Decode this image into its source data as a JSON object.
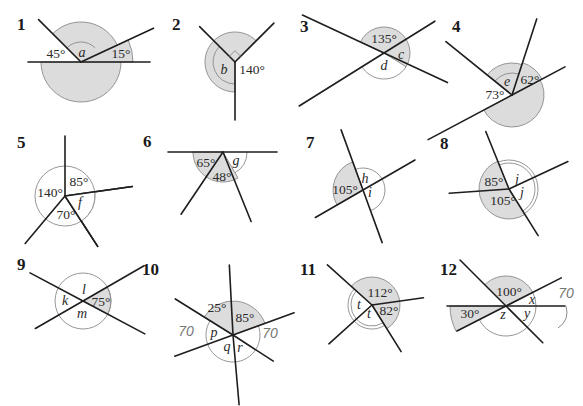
{
  "colors": {
    "shade": "#dcdcdc",
    "line": "#1e1e1e",
    "arc": "#8a8a8a"
  },
  "problems": [
    {
      "number": "1",
      "labels": [
        "45°",
        "a",
        "15°"
      ],
      "given": {
        "45°": 45,
        "15°": 15
      },
      "unknowns": [
        "a"
      ]
    },
    {
      "number": "2",
      "labels": [
        "b",
        "140°"
      ],
      "given": {
        "140°": 140,
        "right_angle": 90
      },
      "unknowns": [
        "b"
      ]
    },
    {
      "number": "3",
      "labels": [
        "135°",
        "c",
        "d"
      ],
      "given": {
        "135°": 135
      },
      "unknowns": [
        "c",
        "d"
      ]
    },
    {
      "number": "4",
      "labels": [
        "e",
        "62°",
        "73°"
      ],
      "given": {
        "62°": 62,
        "73°": 73
      },
      "unknowns": [
        "e"
      ]
    },
    {
      "number": "5",
      "labels": [
        "140°",
        "85°",
        "f",
        "70°"
      ],
      "given": {
        "140°": 140,
        "85°": 85,
        "70°": 70
      },
      "unknowns": [
        "f"
      ]
    },
    {
      "number": "6",
      "labels": [
        "65°",
        "g",
        "48°"
      ],
      "given": {
        "65°": 65,
        "48°": 48
      },
      "unknowns": [
        "g"
      ]
    },
    {
      "number": "7",
      "labels": [
        "105°",
        "h",
        "i"
      ],
      "given": {
        "105°": 105
      },
      "unknowns": [
        "h",
        "i"
      ]
    },
    {
      "number": "8",
      "labels": [
        "85°",
        "j",
        "j",
        "105°"
      ],
      "given": {
        "85°": 85,
        "105°": 105
      },
      "unknowns": [
        "j"
      ]
    },
    {
      "number": "9",
      "labels": [
        "k",
        "l",
        "75°",
        "m"
      ],
      "given": {
        "75°": 75
      },
      "unknowns": [
        "k",
        "l",
        "m"
      ]
    },
    {
      "number": "10",
      "labels": [
        "25°",
        "85°",
        "p",
        "q",
        "r"
      ],
      "given": {
        "25°": 25,
        "85°": 85
      },
      "unknowns": [
        "p",
        "q",
        "r"
      ],
      "handwriting": [
        "70",
        "70"
      ]
    },
    {
      "number": "11",
      "labels": [
        "112°",
        "t",
        "t",
        "82°"
      ],
      "given": {
        "112°": 112,
        "82°": 82
      },
      "unknowns": [
        "t"
      ]
    },
    {
      "number": "12",
      "labels": [
        "100°",
        "x",
        "30°",
        "z",
        "y"
      ],
      "given": {
        "100°": 100,
        "30°": 30
      },
      "unknowns": [
        "x",
        "y",
        "z"
      ],
      "handwriting": [
        "70"
      ]
    }
  ]
}
